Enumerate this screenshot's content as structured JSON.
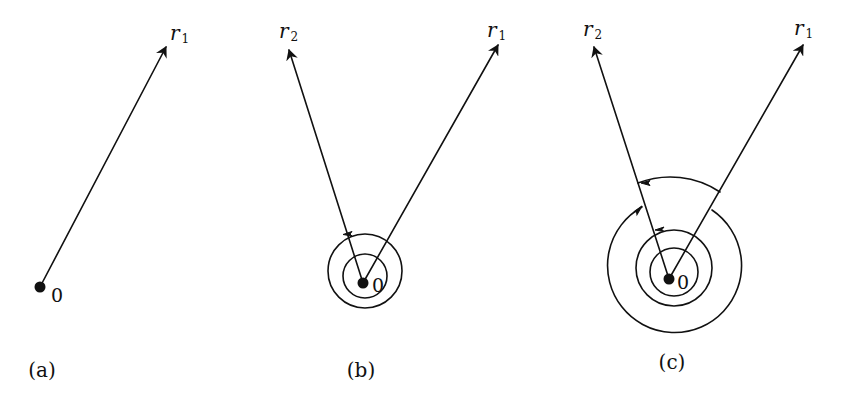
{
  "panels": [
    {
      "id": "a",
      "caption": "(a)",
      "origin_label": "0",
      "vectors": [
        {
          "name": "r",
          "sub": "1"
        }
      ],
      "winding_turns": 0
    },
    {
      "id": "b",
      "caption": "(b)",
      "origin_label": "0",
      "vectors": [
        {
          "name": "r",
          "sub": "2"
        },
        {
          "name": "r",
          "sub": "1"
        }
      ],
      "winding_turns": 2
    },
    {
      "id": "c",
      "caption": "(c)",
      "origin_label": "0",
      "vectors": [
        {
          "name": "r",
          "sub": "2"
        },
        {
          "name": "r",
          "sub": "1"
        }
      ],
      "winding_turns": 3
    }
  ],
  "colors": {
    "ink": "#111111",
    "background": "#ffffff"
  }
}
